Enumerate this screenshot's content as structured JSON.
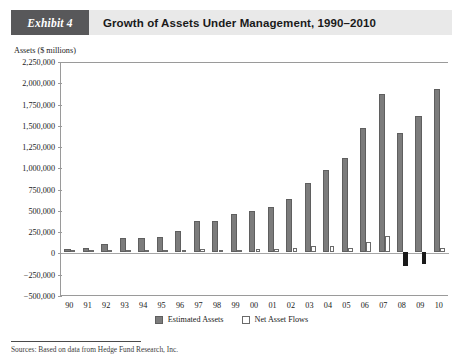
{
  "header": {
    "exhibit_label": "Exhibit 4",
    "title": "Growth of Assets Under Management, 1990–2010"
  },
  "footnote": {
    "text": "Sources: Based on data from Hedge Fund Research, Inc."
  },
  "chart_data": {
    "type": "bar",
    "title": "Growth of Assets Under Management, 1990–2010",
    "xlabel": "",
    "ylabel": "Assets ($ millions)",
    "ylim": [
      -500000,
      2250000
    ],
    "ytick_step": 250000,
    "grid": false,
    "legend_position": "bottom",
    "ytick_labels": [
      "2,250,000",
      "2,000,000",
      "1,750,000",
      "1,500,000",
      "1,250,000",
      "1,000,000",
      "750,000",
      "500,000",
      "250,000",
      "0",
      "−250,000",
      "−500,000"
    ],
    "ytick_values": [
      2250000,
      2000000,
      1750000,
      1500000,
      1250000,
      1000000,
      750000,
      500000,
      250000,
      0,
      -250000,
      -500000
    ],
    "categories": [
      "90",
      "91",
      "92",
      "93",
      "94",
      "95",
      "96",
      "97",
      "98",
      "99",
      "00",
      "01",
      "02",
      "03",
      "04",
      "05",
      "06",
      "07",
      "08",
      "09",
      "10"
    ],
    "series": [
      {
        "name": "Estimated Assets",
        "color": "#7c7c7c",
        "values": [
          39000,
          58000,
          95000,
          167000,
          167000,
          185000,
          256000,
          368000,
          374000,
          456000,
          490000,
          539000,
          625000,
          820000,
          973000,
          1105000,
          1465000,
          1868000,
          1407000,
          1600000,
          1917000
        ]
      },
      {
        "name": "Net Asset Flows",
        "color": "#ffffff",
        "negative_color": "#1a1a1a",
        "values": [
          4000,
          6000,
          18000,
          30000,
          17000,
          15000,
          28000,
          37000,
          22000,
          30000,
          36000,
          44000,
          48000,
          73000,
          73000,
          47000,
          126000,
          194000,
          -154000,
          -131000,
          55000
        ]
      }
    ]
  }
}
